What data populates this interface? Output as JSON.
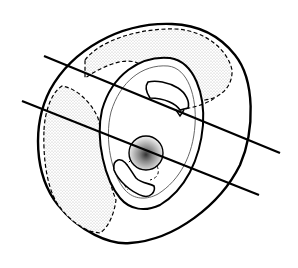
{
  "figure": {
    "description": "Line drawing of a rounded shell-like object with a central hub, concentric rings, stippled shaded regions, and two parallel straight lines passing obliquely through it",
    "stroke_color": "#000000",
    "fill_color": "#ffffff",
    "stipple_color": "#9a9a9a",
    "lines": [
      {
        "x1": 44,
        "y1": 56,
        "x2": 280,
        "y2": 153
      },
      {
        "x1": 22,
        "y1": 101,
        "x2": 259,
        "y2": 195
      }
    ]
  }
}
